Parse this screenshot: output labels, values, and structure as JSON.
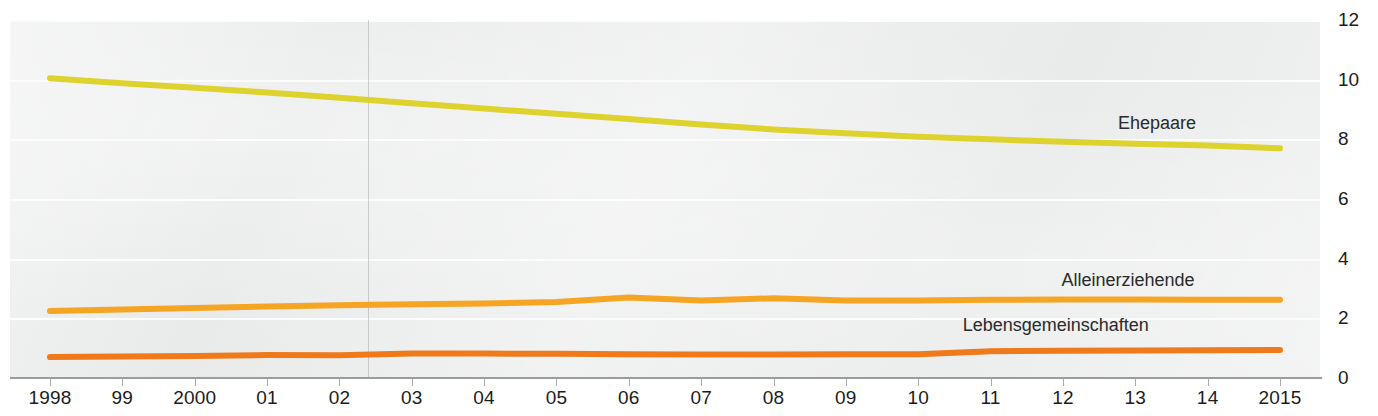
{
  "chart_data": {
    "type": "line",
    "title": "",
    "subtitle": "",
    "xlabel": "",
    "ylabel": "",
    "ylim": [
      0,
      12
    ],
    "yticks": [
      0,
      2,
      4,
      6,
      8,
      10,
      12
    ],
    "ytick_labels": [
      "0",
      "2",
      "4",
      "6",
      "8",
      "10",
      "12"
    ],
    "grid": true,
    "grid_axis": "y",
    "legend_position": "inline-right",
    "x": [
      1998,
      1999,
      2000,
      2001,
      2002,
      2003,
      2004,
      2005,
      2006,
      2007,
      2008,
      2009,
      2010,
      2011,
      2012,
      2013,
      2014,
      2015
    ],
    "categories": [
      "1998",
      "99",
      "2000",
      "01",
      "02",
      "03",
      "04",
      "05",
      "06",
      "07",
      "08",
      "09",
      "10",
      "11",
      "12",
      "13",
      "14",
      "2015"
    ],
    "series": [
      {
        "name": "Ehepaare",
        "color": "#ded22e",
        "label_x": 2013.3,
        "label_y": 8.55,
        "values": [
          10.05,
          9.88,
          9.73,
          9.57,
          9.39,
          9.21,
          9.03,
          8.86,
          8.68,
          8.5,
          8.33,
          8.2,
          8.09,
          8.0,
          7.92,
          7.85,
          7.79,
          7.7
        ]
      },
      {
        "name": "Alleinerziehende",
        "color": "#f5a423",
        "label_x": 2012.9,
        "label_y": 3.28,
        "values": [
          2.25,
          2.3,
          2.35,
          2.4,
          2.44,
          2.47,
          2.5,
          2.55,
          2.7,
          2.6,
          2.67,
          2.6,
          2.6,
          2.62,
          2.63,
          2.63,
          2.62,
          2.62
        ]
      },
      {
        "name": "Lebensgemeinschaften",
        "color": "#ef7a1c",
        "label_x": 2011.9,
        "label_y": 1.77,
        "values": [
          0.7,
          0.72,
          0.74,
          0.77,
          0.76,
          0.82,
          0.82,
          0.81,
          0.8,
          0.79,
          0.79,
          0.8,
          0.8,
          0.9,
          0.91,
          0.92,
          0.93,
          0.94
        ]
      }
    ]
  },
  "axes": {
    "y_axis_name": "y-axis",
    "x_axis_name": "x-axis"
  }
}
